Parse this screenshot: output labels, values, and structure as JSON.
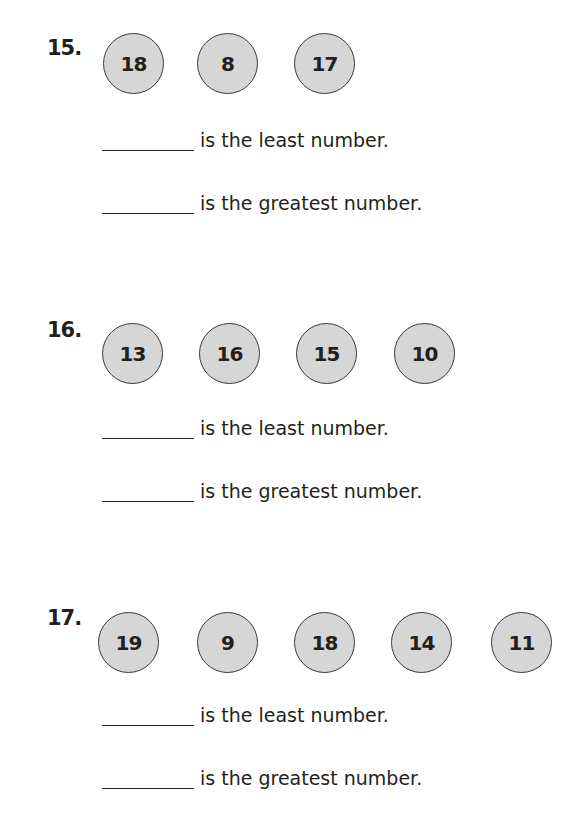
{
  "problems": [
    {
      "number": "15.",
      "numbers": [
        "18",
        "8",
        "17"
      ],
      "statements": [
        "is the least number.",
        "is the greatest number."
      ]
    },
    {
      "number": "16.",
      "numbers": [
        "13",
        "16",
        "15",
        "10"
      ],
      "statements": [
        "is the least number.",
        "is the greatest number."
      ]
    },
    {
      "number": "17.",
      "numbers": [
        "19",
        "9",
        "18",
        "14",
        "11"
      ],
      "statements": [
        "is the least number.",
        "is the greatest number."
      ]
    }
  ],
  "colors": {
    "circle_fill": "#d6d6d6",
    "circle_border": "#3a3a3a",
    "text": "#231f20"
  }
}
